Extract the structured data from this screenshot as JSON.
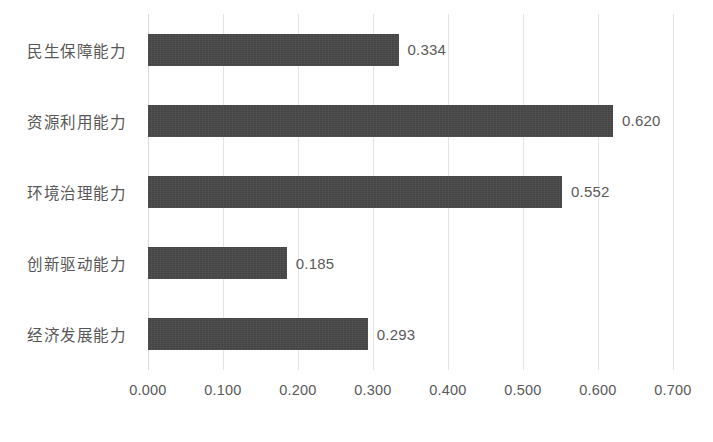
{
  "chart_data": {
    "type": "bar",
    "orientation": "horizontal",
    "title": "",
    "subtitle": "",
    "xlabel": "",
    "ylabel": "",
    "categories": [
      "经济发展能力",
      "创新驱动能力",
      "环境治理能力",
      "资源利用能力",
      "民生保障能力"
    ],
    "values": [
      0.293,
      0.185,
      0.552,
      0.62,
      0.334
    ],
    "value_labels": [
      "0.293",
      "0.185",
      "0.552",
      "0.620",
      "0.334"
    ],
    "xlim": [
      0.0,
      0.7
    ],
    "xticks": [
      0.0,
      0.1,
      0.2,
      0.3,
      0.4,
      0.5,
      0.6,
      0.7
    ],
    "xtick_labels": [
      "0.000",
      "0.100",
      "0.200",
      "0.300",
      "0.400",
      "0.500",
      "0.600",
      "0.700"
    ],
    "grid": "vertical",
    "legend": null,
    "bars_top_to_bottom": [
      {
        "category": "民生保障能力",
        "value": 0.334,
        "label": "0.334"
      },
      {
        "category": "资源利用能力",
        "value": 0.62,
        "label": "0.620"
      },
      {
        "category": "环境治理能力",
        "value": 0.552,
        "label": "0.552"
      },
      {
        "category": "创新驱动能力",
        "value": 0.185,
        "label": "0.185"
      },
      {
        "category": "经济发展能力",
        "value": 0.293,
        "label": "0.293"
      }
    ],
    "colors": {
      "bar": "#444444",
      "gridline": "#e4e4e4",
      "axis": "#d9d9d9",
      "text": "#575757",
      "background": "#ffffff"
    }
  }
}
